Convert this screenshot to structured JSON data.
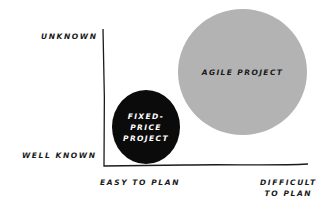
{
  "diagram": {
    "type": "2x2-positioning",
    "y_axis": {
      "top_label": "UNKNOWN",
      "bottom_label": "WELL KNOWN"
    },
    "x_axis": {
      "left_label": "EASY TO PLAN",
      "right_label": "DIFFICULT\nTO PLAN"
    },
    "items": [
      {
        "label": "FIXED-\nPRICE\nPROJECT",
        "fill": "#0b0b0b",
        "text_color": "#ffffff"
      },
      {
        "label": "AGILE PROJECT",
        "fill": "#b3b3b3",
        "text_color": "#1a1a1a"
      }
    ],
    "colors": {
      "axis": "#1a1a1a",
      "background": "#ffffff"
    }
  }
}
